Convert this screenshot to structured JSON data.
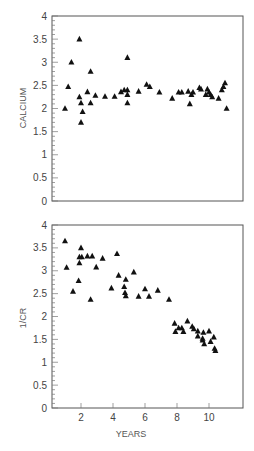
{
  "chart_data": [
    {
      "type": "scatter",
      "title": "",
      "xlabel": "",
      "ylabel": "CALCIUM",
      "xlim": [
        0,
        12
      ],
      "ylim": [
        0,
        4
      ],
      "yticks": [
        "0",
        "0.5",
        "1",
        "1.5",
        "2",
        "2.5",
        "3",
        "3.5",
        "4"
      ],
      "xticks": [],
      "marker": "triangle",
      "grid": false,
      "legend": null,
      "series": [
        {
          "name": "Calcium",
          "points": [
            [
              1.0,
              2.0
            ],
            [
              1.2,
              2.47
            ],
            [
              1.4,
              3.0
            ],
            [
              1.9,
              3.5
            ],
            [
              1.9,
              2.25
            ],
            [
              2.0,
              2.12
            ],
            [
              2.0,
              1.7
            ],
            [
              2.1,
              1.93
            ],
            [
              2.4,
              2.36
            ],
            [
              2.6,
              2.8
            ],
            [
              2.6,
              2.12
            ],
            [
              2.9,
              2.28
            ],
            [
              3.5,
              2.26
            ],
            [
              4.1,
              2.26
            ],
            [
              4.5,
              2.36
            ],
            [
              4.7,
              2.4
            ],
            [
              4.9,
              3.1
            ],
            [
              4.9,
              2.4
            ],
            [
              4.9,
              2.3
            ],
            [
              4.9,
              2.12
            ],
            [
              5.6,
              2.37
            ],
            [
              6.1,
              2.52
            ],
            [
              6.3,
              2.47
            ],
            [
              6.9,
              2.35
            ],
            [
              7.7,
              2.22
            ],
            [
              8.1,
              2.35
            ],
            [
              8.3,
              2.35
            ],
            [
              8.7,
              2.37
            ],
            [
              8.8,
              2.1
            ],
            [
              8.9,
              2.3
            ],
            [
              9.0,
              2.35
            ],
            [
              9.4,
              2.45
            ],
            [
              9.5,
              2.42
            ],
            [
              9.8,
              2.3
            ],
            [
              9.9,
              2.42
            ],
            [
              10.0,
              2.35
            ],
            [
              10.1,
              2.3
            ],
            [
              10.2,
              2.25
            ],
            [
              10.6,
              2.22
            ],
            [
              10.8,
              2.4
            ],
            [
              10.9,
              2.47
            ],
            [
              11.0,
              2.55
            ],
            [
              11.1,
              2.0
            ]
          ]
        }
      ]
    },
    {
      "type": "scatter",
      "title": "",
      "xlabel": "YEARS",
      "ylabel": "1/CR",
      "xlim": [
        0,
        12
      ],
      "ylim": [
        0,
        4
      ],
      "yticks": [
        "0",
        "0.5",
        "1",
        "1.5",
        "2",
        "2.5",
        "3",
        "3.5",
        "4"
      ],
      "xticks": [
        "2",
        "4",
        "6",
        "8",
        "10"
      ],
      "marker": "triangle",
      "grid": false,
      "legend": null,
      "series": [
        {
          "name": "1/CR",
          "points": [
            [
              1.0,
              3.65
            ],
            [
              1.1,
              3.07
            ],
            [
              1.5,
              2.55
            ],
            [
              1.85,
              2.78
            ],
            [
              1.9,
              3.17
            ],
            [
              1.9,
              3.3
            ],
            [
              2.0,
              3.5
            ],
            [
              2.05,
              3.3
            ],
            [
              2.4,
              3.32
            ],
            [
              2.6,
              2.37
            ],
            [
              2.7,
              3.32
            ],
            [
              2.95,
              3.08
            ],
            [
              3.35,
              3.27
            ],
            [
              3.9,
              2.62
            ],
            [
              4.25,
              3.37
            ],
            [
              4.35,
              2.9
            ],
            [
              4.7,
              2.65
            ],
            [
              4.75,
              2.52
            ],
            [
              4.8,
              2.45
            ],
            [
              4.8,
              2.81
            ],
            [
              5.3,
              2.97
            ],
            [
              5.6,
              2.44
            ],
            [
              6.0,
              2.6
            ],
            [
              6.25,
              2.44
            ],
            [
              6.8,
              2.57
            ],
            [
              7.5,
              2.37
            ],
            [
              7.85,
              1.85
            ],
            [
              7.9,
              1.67
            ],
            [
              8.1,
              1.75
            ],
            [
              8.3,
              1.75
            ],
            [
              8.4,
              1.67
            ],
            [
              8.65,
              1.9
            ],
            [
              8.95,
              1.78
            ],
            [
              9.05,
              1.73
            ],
            [
              9.3,
              1.68
            ],
            [
              9.3,
              1.57
            ],
            [
              9.6,
              1.48
            ],
            [
              9.6,
              1.52
            ],
            [
              9.65,
              1.65
            ],
            [
              9.7,
              1.4
            ],
            [
              10.0,
              1.68
            ],
            [
              10.1,
              1.45
            ],
            [
              10.3,
              1.55
            ],
            [
              10.35,
              1.3
            ],
            [
              10.4,
              1.25
            ]
          ]
        }
      ]
    }
  ],
  "labels": {
    "top_ylabel": "CALCIUM",
    "bottom_ylabel": "1/CR",
    "bottom_xlabel": "YEARS"
  }
}
